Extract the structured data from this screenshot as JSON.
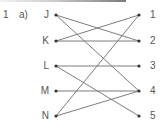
{
  "question": {
    "number": "1",
    "part": "a)"
  },
  "left_items": [
    {
      "label": "J",
      "y": 15
    },
    {
      "label": "K",
      "y": 41
    },
    {
      "label": "L",
      "y": 66
    },
    {
      "label": "M",
      "y": 91
    },
    {
      "label": "N",
      "y": 116
    }
  ],
  "right_items": [
    {
      "label": "1",
      "y": 15
    },
    {
      "label": "2",
      "y": 41
    },
    {
      "label": "3",
      "y": 66
    },
    {
      "label": "4",
      "y": 91
    },
    {
      "label": "5",
      "y": 116
    }
  ],
  "connections": [
    [
      "J",
      "2"
    ],
    [
      "J",
      "4"
    ],
    [
      "K",
      "1"
    ],
    [
      "K",
      "2"
    ],
    [
      "L",
      "3"
    ],
    [
      "L",
      "5"
    ],
    [
      "M",
      "4"
    ],
    [
      "N",
      "1"
    ],
    [
      "N",
      "4"
    ]
  ],
  "colors": {
    "line": "#6e6e6e",
    "dot": "#333333",
    "text": "#555555"
  }
}
